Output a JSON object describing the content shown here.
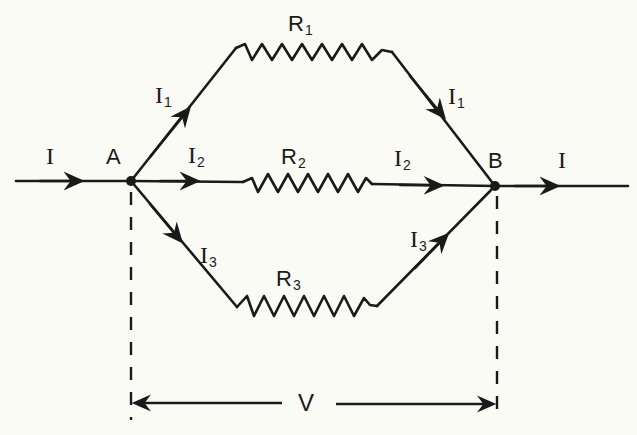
{
  "diagram": {
    "nodes": [
      {
        "id": "A",
        "label": "A",
        "x": 131,
        "y": 181
      },
      {
        "id": "B",
        "label": "B",
        "x": 495,
        "y": 186
      }
    ],
    "resistors": [
      {
        "id": "R1",
        "label": "R",
        "sub": "1",
        "branch": "top"
      },
      {
        "id": "R2",
        "label": "R",
        "sub": "2",
        "branch": "middle"
      },
      {
        "id": "R3",
        "label": "R",
        "sub": "3",
        "branch": "bottom"
      }
    ],
    "currents": {
      "total": {
        "label": "I",
        "sub": ""
      },
      "i1": {
        "label": "I",
        "sub": "1"
      },
      "i2": {
        "label": "I",
        "sub": "2"
      },
      "i3": {
        "label": "I",
        "sub": "3"
      }
    },
    "voltage": {
      "label": "V"
    },
    "colors": {
      "ink": "#1a1a1a",
      "paper": "#fbfbf6"
    }
  }
}
